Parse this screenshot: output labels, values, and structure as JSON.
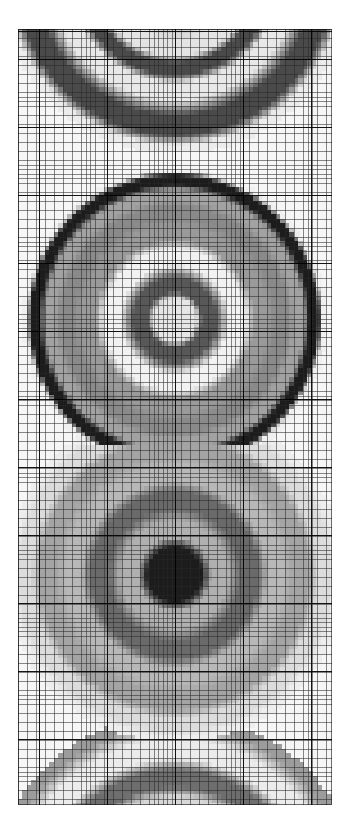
{
  "figure": {
    "title": "",
    "kind": "pixelated-grayscale-raster",
    "canvas": {
      "width": 350,
      "height": 840,
      "background": "#ffffff"
    },
    "plot_area": {
      "left": 18,
      "top": 29,
      "width": 314,
      "height": 776
    }
  },
  "grid": {
    "minor_spacing_px": 4.53,
    "major_spacing_px": 68,
    "minor_color": "#282828",
    "major_color": "#000000",
    "border_color": "#000000",
    "visible": true
  },
  "palette": {
    "black": "#1c1c1c",
    "near_black": "#2e2e2e",
    "dark_gray": "#4a4a4a",
    "mid_dark_gray": "#6e6e6e",
    "mid_gray": "#8f8f8f",
    "light_mid_gray": "#ababab",
    "light_gray": "#c6c6c6",
    "very_light_gray": "#dedede",
    "white": "#f6f6f6"
  },
  "chart_data": {
    "type": "heatmap",
    "title": "",
    "subtitle": "",
    "xlabel": "",
    "ylabel": "",
    "xlim": [
      0,
      314
    ],
    "ylim": [
      0,
      776
    ],
    "grid": true,
    "legend": null,
    "colormap": "grayscale",
    "value_range": [
      0,
      1
    ],
    "cell_size_px": 4.53,
    "pattern": "concentric-rings",
    "annotations": [],
    "rings": [
      {
        "name": "bullseye-top-partial",
        "cx": 157,
        "cy": -52,
        "clipped": "top",
        "bands": [
          {
            "r": 36,
            "shade": "#b4b4b4"
          },
          {
            "r": 74,
            "shade": "#e4e4e4"
          },
          {
            "r": 92,
            "shade": "#4a4a4a"
          },
          {
            "r": 112,
            "shade": "#e8e8e8"
          },
          {
            "r": 150,
            "shade": "#4a4a4a"
          },
          {
            "r": 176,
            "shade": "#ececec"
          }
        ]
      },
      {
        "name": "bullseye-upper",
        "cx": 157,
        "cy": 291,
        "clipped": "none",
        "bands": [
          {
            "r": 17,
            "shade": "#e6e6e6"
          },
          {
            "r": 32,
            "shade": "#585858"
          },
          {
            "r": 64,
            "shade": "#f2f2f2"
          },
          {
            "r": 86,
            "shade": "#9a9a9a"
          },
          {
            "r": 108,
            "shade": "#8a8a8a"
          },
          {
            "r": 125,
            "shade": "#a2a2a2"
          },
          {
            "r": 140,
            "shade": "#1c1c1c"
          },
          {
            "r": 152,
            "shade": "#f0f0f0"
          }
        ]
      },
      {
        "name": "bullseye-lower",
        "cx": 157,
        "cy": 546,
        "clipped": "none",
        "bands": [
          {
            "r": 20,
            "shade": "#1c1c1c"
          },
          {
            "r": 44,
            "shade": "#b0b0b0"
          },
          {
            "r": 76,
            "shade": "#6a6a6a"
          },
          {
            "r": 100,
            "shade": "#b8b8b8"
          },
          {
            "r": 128,
            "shade": "#a4a4a4"
          },
          {
            "r": 150,
            "shade": "#dcdcdc"
          },
          {
            "r": 168,
            "shade": "#eeeeee"
          }
        ]
      },
      {
        "name": "bullseye-bottom-partial",
        "cx": 157,
        "cy": 872,
        "clipped": "bottom",
        "bands": [
          {
            "r": 44,
            "shade": "#c4c4c4"
          },
          {
            "r": 70,
            "shade": "#7c7c7c"
          },
          {
            "r": 96,
            "shade": "#d8d8d8"
          },
          {
            "r": 122,
            "shade": "#6e6e6e"
          },
          {
            "r": 150,
            "shade": "#ececec"
          },
          {
            "r": 186,
            "shade": "#9c9c9c"
          }
        ]
      }
    ]
  }
}
